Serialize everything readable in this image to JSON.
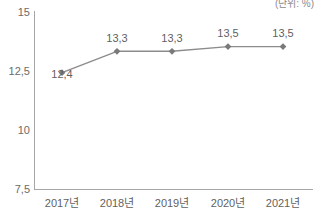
{
  "chart_data": {
    "type": "line",
    "title": "",
    "subtitle": "",
    "unit_note": "(단위: %)",
    "xlabel": "",
    "ylabel": "",
    "categories": [
      "2017년",
      "2018년",
      "2019년",
      "2020년",
      "2021년"
    ],
    "values": [
      12.4,
      13.3,
      13.3,
      13.5,
      13.5
    ],
    "data_labels": [
      "12,4",
      "13,3",
      "13,3",
      "13,5",
      "13,5"
    ],
    "ylim": [
      7.5,
      15
    ],
    "yticks": [
      15,
      12.5,
      10,
      7.5
    ],
    "ytick_labels": [
      "15",
      "12,5",
      "10",
      "7,5"
    ],
    "grid": false,
    "legend": null,
    "series": [
      {
        "name": "series-1",
        "values": [
          12.4,
          13.3,
          13.3,
          13.5,
          13.5
        ],
        "marker": "diamond",
        "line_color": "#8c8c8c",
        "marker_color": "#7a7a7a"
      }
    ],
    "colors": {
      "line": "#8c8c8c",
      "marker": "#7a7a7a",
      "axis": "#a6a6a6",
      "text": "#5f5f5f",
      "background": "#ffffff"
    }
  }
}
